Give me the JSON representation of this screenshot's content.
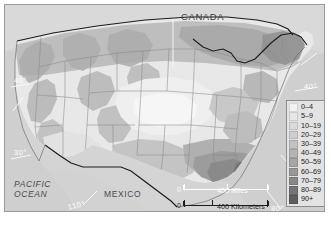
{
  "figure": {
    "type": "thematic-choropleth-map",
    "region": "United States"
  },
  "map_labels": {
    "canada": "CANADA",
    "mexico": "MEXICO",
    "pacific_ocean": "PACIFIC\nOCEAN",
    "pacific_ocean_line1": "PACIFIC",
    "pacific_ocean_line2": "OCEAN",
    "lat_40_left": "40°",
    "lat_30_left": "30°",
    "lat_40_right": "40°",
    "lon_110": "110°",
    "lon_80": "80°"
  },
  "legend": {
    "items": [
      {
        "label": "0–4",
        "color": "#f2f2f2"
      },
      {
        "label": "5–9",
        "color": "#e6e6e6"
      },
      {
        "label": "10–19",
        "color": "#dadada"
      },
      {
        "label": "20–29",
        "color": "#cecece"
      },
      {
        "label": "30–39",
        "color": "#c2c2c2"
      },
      {
        "label": "40–49",
        "color": "#b4b4b4"
      },
      {
        "label": "50–59",
        "color": "#a6a6a6"
      },
      {
        "label": "60–69",
        "color": "#989898"
      },
      {
        "label": "70–79",
        "color": "#888888"
      },
      {
        "label": "80–89",
        "color": "#757575"
      },
      {
        "label": "90+",
        "color": "#5e5e5e"
      }
    ]
  },
  "scale": {
    "miles": {
      "zero": "0",
      "label": "400 Miles"
    },
    "kilometers": {
      "zero": "0",
      "label": "400 Kilometers"
    }
  },
  "colors": {
    "frame_border": "#9a9a9a",
    "water": "#cfcfcf",
    "land_base": "#dcdcdc",
    "border_line": "#1c1c1c",
    "state_line": "#8f8f8f",
    "graticule": "#ffffff"
  }
}
